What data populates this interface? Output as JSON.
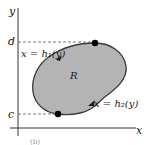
{
  "diagram": {
    "axes": {
      "x_label": "x",
      "y_label": "y"
    },
    "levels": {
      "d_label": "d",
      "c_label": "c"
    },
    "region_label": "R",
    "curves": {
      "left_boundary": "x = h₁(y)",
      "right_boundary": "x = h₂(y)"
    },
    "colors": {
      "region_fill": "#b4b4b4",
      "region_stroke": "#3a3a3a",
      "axis": "#333333",
      "dot": "#000000"
    },
    "caption": "(b)"
  }
}
